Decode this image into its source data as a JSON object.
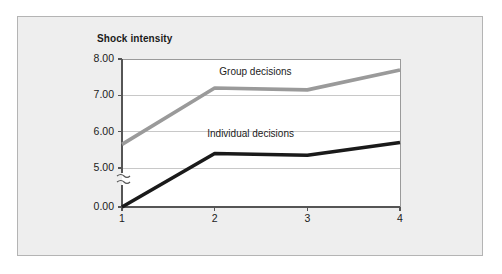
{
  "figure": {
    "background_color": "#eeeeee",
    "border_color": "#b4b4b4",
    "plot_background_color": "#ffffff"
  },
  "chart_data": {
    "type": "line",
    "title": "",
    "xlabel": "Phase of experiment",
    "ylabel": "Shock intensity",
    "x": [
      1,
      2,
      3,
      4
    ],
    "categories": [
      "1",
      "2",
      "3",
      "4"
    ],
    "series": [
      {
        "name": "Group decisions",
        "values": [
          5.65,
          7.2,
          7.15,
          7.7
        ],
        "color": "#9a9a9a"
      },
      {
        "name": "Individual decisions",
        "values": [
          4.85,
          5.4,
          5.35,
          5.7
        ],
        "color": "#1a1a1a"
      }
    ],
    "ylim": [
      0.0,
      8.0
    ],
    "yticks": [
      0.0,
      5.0,
      6.0,
      7.0,
      8.0
    ],
    "ytick_labels": [
      "0.00",
      "5.00",
      "6.00",
      "7.00",
      "8.00"
    ],
    "xticks": [
      1,
      2,
      3,
      4
    ],
    "xtick_labels": [
      "1",
      "2",
      "3",
      "4"
    ],
    "grid": true,
    "grid_color": "#c8c8c8",
    "axis_break": true,
    "axis_break_position": 2.5,
    "legend_position": "inline-annotations",
    "annotations": [
      {
        "text": "Group decisions",
        "x": 2.05,
        "y": 7.62
      },
      {
        "text": "Individual decisions",
        "x": 1.92,
        "y": 5.92
      }
    ]
  },
  "labels": {
    "y_axis_title": "Shock intensity",
    "x_axis_title": "Phase of experiment",
    "y_ticks": [
      "8.00",
      "7.00",
      "6.00",
      "5.00",
      "0.00"
    ],
    "x_ticks": [
      "1",
      "2",
      "3",
      "4"
    ],
    "series_group": "Group decisions",
    "series_individual": "Individual decisions"
  }
}
